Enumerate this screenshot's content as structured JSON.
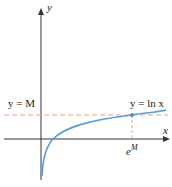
{
  "axes": {
    "x_label": "x",
    "y_label": "y"
  },
  "curve": {
    "label": "y = ln x",
    "color": "#5b9bd5"
  },
  "horizontal_line": {
    "label": "y = M",
    "color": "#e8a38a"
  },
  "point": {
    "x_label": "e",
    "x_label_sup": "M"
  },
  "colors": {
    "axis": "#333333",
    "curve": "#5b9bd5",
    "dash": "#e8a38a"
  }
}
